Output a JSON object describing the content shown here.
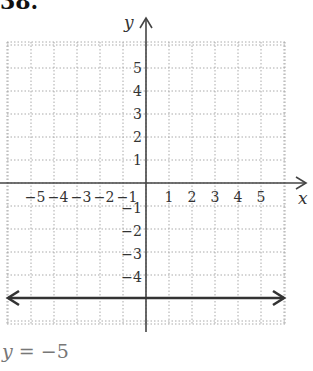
{
  "problem_number": "38.",
  "caption": {
    "variable": "y",
    "equals": "=",
    "value": "−5"
  },
  "chart_data": {
    "type": "line",
    "title": "",
    "equation": "y = -5",
    "xlabel": "x",
    "ylabel": "y",
    "xlim": [
      -6,
      6
    ],
    "ylim": [
      -6,
      6
    ],
    "grid": true,
    "grid_style": "dotted",
    "x_ticks": [
      -5,
      -4,
      -3,
      -2,
      -1,
      1,
      2,
      3,
      4,
      5
    ],
    "y_ticks": [
      5,
      4,
      3,
      2,
      1,
      -1,
      -2,
      -3,
      -4
    ],
    "x_tick_labels": [
      "−5",
      "−4",
      "−3",
      "−2",
      "−1",
      "1",
      "2",
      "3",
      "4",
      "5"
    ],
    "y_tick_labels": [
      "5",
      "4",
      "3",
      "2",
      "1",
      "−1",
      "−2",
      "−3",
      "−4"
    ],
    "series": [
      {
        "name": "y = -5",
        "x": [
          -6,
          6
        ],
        "y": [
          -5,
          -5
        ],
        "style": "line with arrows both ends",
        "color": "#333333"
      }
    ]
  }
}
